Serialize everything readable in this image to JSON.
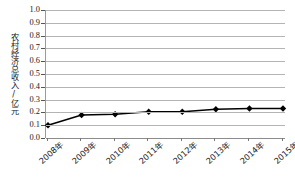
{
  "chart_data": {
    "type": "line",
    "title": "",
    "subtitle": "",
    "xlabel": "",
    "ylabel": "农村经济总收入/亿元",
    "categories": [
      "2008年",
      "2009年",
      "2010年",
      "2011年",
      "2012年",
      "2013年",
      "2014年",
      "2015年"
    ],
    "values": [
      0.1,
      0.18,
      0.185,
      0.205,
      0.205,
      0.225,
      0.23,
      0.23
    ],
    "series": [
      {
        "name": "农村经济总收入",
        "values": [
          0.1,
          0.18,
          0.185,
          0.205,
          0.205,
          0.225,
          0.23,
          0.23
        ]
      }
    ],
    "ylim": [
      0.0,
      1.0
    ],
    "ytick_step": 0.1,
    "ytick_labels": [
      "0.0",
      "0.1",
      "0.2",
      "0.3",
      "0.4",
      "0.5",
      "0.6",
      "0.7",
      "0.8",
      "0.9",
      "1.0"
    ],
    "grid": true,
    "grid_axis": "y",
    "legend": false,
    "legend_position": "none",
    "marker": "diamond",
    "line_color": "#000000",
    "marker_color": "#000000",
    "gridline_color": "#b4b4b4",
    "background_color": "#ffffff",
    "xtick_rotation": -42
  }
}
